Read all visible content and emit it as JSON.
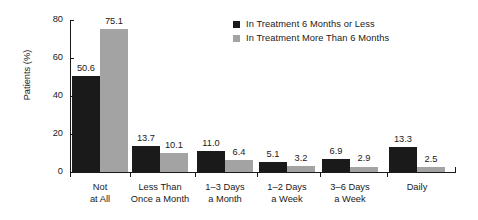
{
  "chart_data": {
    "type": "bar",
    "title": "",
    "xlabel": "",
    "ylabel": "Patients (%)",
    "ylim": [
      0,
      80
    ],
    "yticks": [
      0,
      20,
      40,
      60,
      80
    ],
    "grid": false,
    "legend_position": "top-right",
    "categories": [
      "Not\nat All",
      "Less Than\nOnce a Month",
      "1–3 Days\na Month",
      "1–2 Days\na Week",
      "3–6 Days\na Week",
      "Daily"
    ],
    "category_lines": [
      [
        "Not",
        "at All"
      ],
      [
        "Less Than",
        "Once a Month"
      ],
      [
        "1–3 Days",
        "a Month"
      ],
      [
        "1–2 Days",
        "a Week"
      ],
      [
        "3–6 Days",
        "a Week"
      ],
      [
        "Daily",
        ""
      ]
    ],
    "series": [
      {
        "name": "In Treatment 6 Months or Less",
        "color": "#1a1a1a",
        "values": [
          50.6,
          13.7,
          11.0,
          5.1,
          6.9,
          13.3
        ],
        "labels": [
          "50.6",
          "13.7",
          "11.0",
          "5.1",
          "6.9",
          "13.3"
        ]
      },
      {
        "name": "In Treatment More Than 6 Months",
        "color": "#a3a3a3",
        "values": [
          75.1,
          10.1,
          6.4,
          3.2,
          2.9,
          2.5
        ],
        "labels": [
          "75.1",
          "10.1",
          "6.4",
          "3.2",
          "2.9",
          "2.5"
        ]
      }
    ]
  },
  "axis": {
    "y_tick_labels": [
      "0",
      "20",
      "40",
      "60",
      "80"
    ],
    "y_title": "Patients (%)"
  },
  "legend": {
    "items": [
      {
        "label": "In Treatment 6 Months or Less",
        "color": "#1a1a1a"
      },
      {
        "label": "In Treatment More Than 6 Months",
        "color": "#a3a3a3"
      }
    ]
  }
}
